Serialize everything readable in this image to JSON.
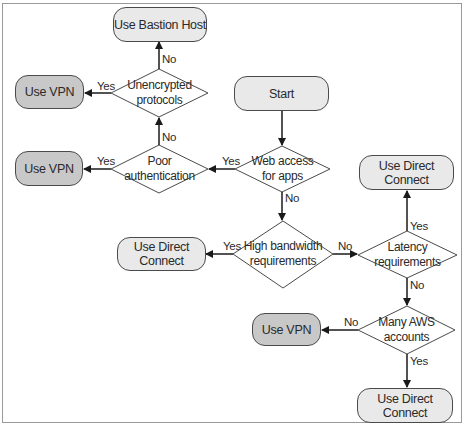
{
  "diagram": {
    "type": "flowchart",
    "nodes": {
      "start": {
        "label": "Start"
      },
      "web_access": {
        "label": "Web access\nfor apps"
      },
      "poor_auth": {
        "label": "Poor\nauthentication"
      },
      "unencrypted": {
        "label": "Unencrypted\nprotocols"
      },
      "bastion": {
        "label": "Use Bastion Host"
      },
      "vpn_top": {
        "label": "Use VPN"
      },
      "vpn_mid": {
        "label": "Use VPN"
      },
      "high_bw": {
        "label": "High bandwidth\nrequirements"
      },
      "dc_left": {
        "label": "Use Direct Connect"
      },
      "latency": {
        "label": "Latency\nrequirements"
      },
      "dc_top_right": {
        "label": "Use Direct Connect"
      },
      "many_aws": {
        "label": "Many AWS\naccounts"
      },
      "vpn_bottom": {
        "label": "Use VPN"
      },
      "dc_bottom": {
        "label": "Use Direct Connect"
      }
    },
    "edges": [
      {
        "from": "start",
        "to": "web_access",
        "label": ""
      },
      {
        "from": "web_access",
        "to": "poor_auth",
        "label": "Yes"
      },
      {
        "from": "web_access",
        "to": "high_bw",
        "label": "No"
      },
      {
        "from": "poor_auth",
        "to": "vpn_mid",
        "label": "Yes"
      },
      {
        "from": "poor_auth",
        "to": "unencrypted",
        "label": "No"
      },
      {
        "from": "unencrypted",
        "to": "vpn_top",
        "label": "Yes"
      },
      {
        "from": "unencrypted",
        "to": "bastion",
        "label": "No"
      },
      {
        "from": "high_bw",
        "to": "dc_left",
        "label": "Yes"
      },
      {
        "from": "high_bw",
        "to": "latency",
        "label": "No"
      },
      {
        "from": "latency",
        "to": "dc_top_right",
        "label": "Yes"
      },
      {
        "from": "latency",
        "to": "many_aws",
        "label": "No"
      },
      {
        "from": "many_aws",
        "to": "vpn_bottom",
        "label": "No"
      },
      {
        "from": "many_aws",
        "to": "dc_bottom",
        "label": "Yes"
      }
    ],
    "edge_labels": {
      "yes": "Yes",
      "no": "No"
    },
    "colors": {
      "terminal_light": "#e9e9e9",
      "terminal_dark": "#c8c8c8",
      "stroke": "#2a2a2a"
    }
  }
}
